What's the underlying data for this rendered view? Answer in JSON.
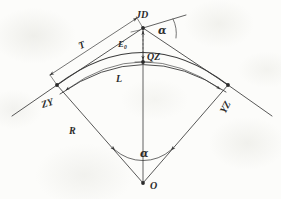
{
  "figure": {
    "kind": "engineering-line-drawing",
    "background_color": "#fbfbf9",
    "ink_color": "#3a3a3a"
  },
  "labels": {
    "jd": "JD",
    "zy": "ZY",
    "yz": "YZ",
    "qz": "QZ",
    "o": "O",
    "t": "T",
    "l": "L",
    "r": "R",
    "e_base": "E",
    "e_sub": "0",
    "alpha_top": "α",
    "alpha_bottom": "α"
  },
  "points": {
    "jd": {
      "x": 143,
      "y": 28
    },
    "zy": {
      "x": 57,
      "y": 85
    },
    "yz": {
      "x": 228,
      "y": 85
    },
    "qz": {
      "x": 143,
      "y": 62
    },
    "o": {
      "x": 143,
      "y": 183
    }
  },
  "geometry": {
    "tangent_label": "T",
    "curve_label": "L",
    "radius_label": "R",
    "external_label": "E0",
    "deflection_angle_label": "alpha",
    "arc_inner_sagitta": 26,
    "arc_outer_sagitta": 22
  }
}
